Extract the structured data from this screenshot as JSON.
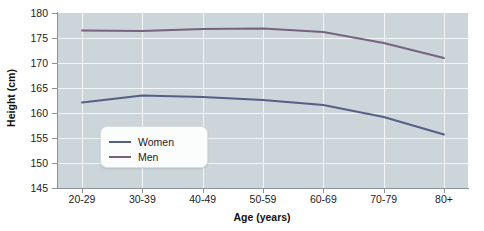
{
  "chart_data": {
    "type": "line",
    "title": "",
    "xlabel": "Age (years)",
    "ylabel": "Height (cm)",
    "categories": [
      "20-29",
      "30-39",
      "40-49",
      "50-59",
      "60-69",
      "70-79",
      "80+"
    ],
    "ylim": [
      145,
      180
    ],
    "y_ticks": [
      145,
      150,
      155,
      160,
      165,
      170,
      175,
      180
    ],
    "grid": true,
    "legend_position": "inside-left",
    "series": [
      {
        "name": "Women",
        "color": "#555f86",
        "values": [
          162.1,
          163.5,
          163.2,
          162.6,
          161.6,
          159.2,
          155.7
        ]
      },
      {
        "name": "Men",
        "color": "#77637f",
        "values": [
          176.5,
          176.4,
          176.8,
          176.9,
          176.2,
          174.0,
          171.0
        ]
      }
    ]
  },
  "legend": {
    "items": [
      {
        "label": "Women",
        "color": "#555f86"
      },
      {
        "label": "Men",
        "color": "#77637f"
      }
    ]
  },
  "colors": {
    "plot_background": "#ccd5d9",
    "gridline": "#f2f6f7",
    "axis": "#8b9398",
    "women_line": "#555f86",
    "men_line": "#77637f"
  }
}
